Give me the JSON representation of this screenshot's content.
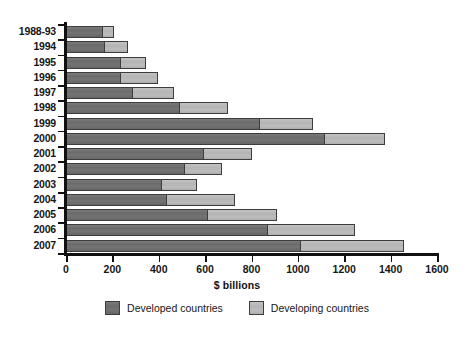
{
  "chart_data": {
    "type": "bar",
    "orientation": "horizontal",
    "stacked": true,
    "title": "",
    "subtitle": "",
    "xlabel": "$ billions",
    "ylabel": "",
    "xlim": [
      0,
      1600
    ],
    "xticks": [
      0,
      200,
      400,
      600,
      800,
      1000,
      1200,
      1400,
      1600
    ],
    "xtick_labels": [
      "0",
      "200",
      "400",
      "600",
      "800",
      "1000",
      "1200",
      "1400",
      "1600"
    ],
    "grid": false,
    "legend_position": "bottom",
    "categories": [
      "1988-93",
      "1994",
      "1995",
      "1996",
      "1997",
      "1998",
      "1999",
      "2000",
      "2001",
      "2002",
      "2003",
      "2004",
      "2005",
      "2006",
      "2007"
    ],
    "series": [
      {
        "name": "Developed countries",
        "color": "#6e6e6e",
        "values": [
          150,
          160,
          228,
          228,
          280,
          483,
          828,
          1108,
          586,
          504,
          405,
          427,
          603,
          862,
          1004
        ]
      },
      {
        "name": "Developing countries",
        "color": "#b9b9b9",
        "values": [
          50,
          100,
          108,
          160,
          177,
          207,
          228,
          258,
          207,
          160,
          151,
          293,
          297,
          375,
          444
        ]
      }
    ],
    "totals": [
      200,
      260,
      336,
      388,
      457,
      690,
      1056,
      1366,
      793,
      664,
      556,
      720,
      900,
      1237,
      1448
    ],
    "legend": [
      {
        "label": "Developed countries",
        "color": "#6e6e6e"
      },
      {
        "label": "Developing countries",
        "color": "#b9b9b9"
      }
    ],
    "axis_color": "#111111",
    "background_color": "#ffffff"
  }
}
